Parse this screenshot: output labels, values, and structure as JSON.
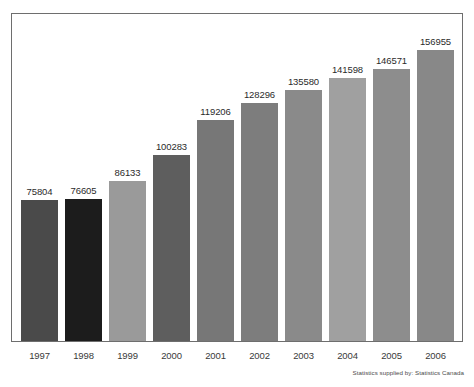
{
  "chart_data": {
    "type": "bar",
    "title": "",
    "subtitle": "",
    "xlabel": "",
    "ylabel": "",
    "grid": false,
    "legend": false,
    "ylim": [
      0,
      165000
    ],
    "categories": [
      "1997",
      "1998",
      "1999",
      "2000",
      "2001",
      "2002",
      "2003",
      "2004",
      "2005",
      "2006"
    ],
    "values": [
      75804,
      76605,
      86133,
      100283,
      119206,
      128296,
      135580,
      141598,
      146571,
      156955
    ],
    "value_labels": [
      "75804",
      "76605",
      "86133",
      "100283",
      "119206",
      "128296",
      "135580",
      "141598",
      "146571",
      "156955"
    ],
    "bar_colors": [
      "#4a4a4a",
      "#1c1c1c",
      "#9a9a9a",
      "#5e5e5e",
      "#777777",
      "#7d7d7d",
      "#8a8a8a",
      "#a0a0a0",
      "#8d8d8d",
      "#888888"
    ],
    "annotations": [
      "Statistics supplied by: Statistics Canada"
    ]
  },
  "footer": {
    "source": "Statistics supplied by: Statistics Canada"
  }
}
